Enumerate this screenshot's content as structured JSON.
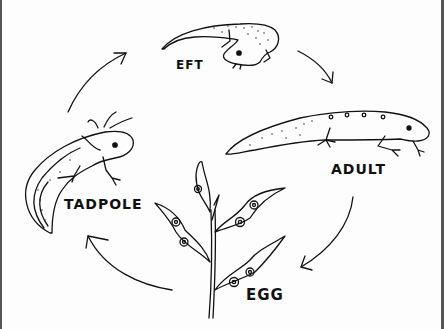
{
  "diagram": {
    "title": "",
    "type": "life-cycle",
    "stages": [
      {
        "id": "eft",
        "label": "EFT"
      },
      {
        "id": "adult",
        "label": "ADULT"
      },
      {
        "id": "egg",
        "label": "EGG"
      },
      {
        "id": "tadpole",
        "label": "TADPOLE"
      }
    ],
    "flow": [
      {
        "from": "EFT",
        "to": "ADULT"
      },
      {
        "from": "ADULT",
        "to": "EGG"
      },
      {
        "from": "EGG",
        "to": "TADPOLE"
      },
      {
        "from": "TADPOLE",
        "to": "EFT"
      }
    ],
    "colors": {
      "stroke": "#111111",
      "background": "#fdfdfd",
      "frame": "#555555"
    }
  }
}
